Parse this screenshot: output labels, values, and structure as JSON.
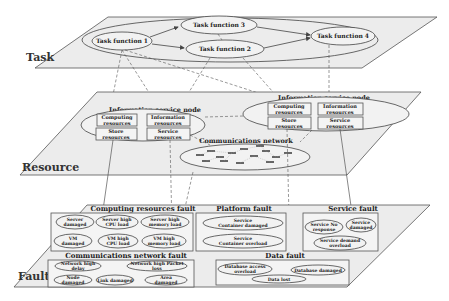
{
  "layers": {
    "task": {
      "label": "Task",
      "functions": [
        "Task function 1",
        "Task function 2",
        "Task function 3",
        "Task function 4"
      ]
    },
    "resource": {
      "label": "Resource",
      "nodes": [
        {
          "title": "Information service node",
          "boxes": [
            {
              "l1": "Computing",
              "l2": "resources"
            },
            {
              "l1": "Information",
              "l2": "resources"
            },
            {
              "l1": "Store",
              "l2": "resources"
            },
            {
              "l1": "Service",
              "l2": "resources"
            }
          ]
        },
        {
          "title": "Information service node",
          "boxes": [
            {
              "l1": "Computing",
              "l2": "resources"
            },
            {
              "l1": "Information",
              "l2": "resources"
            },
            {
              "l1": "Store",
              "l2": "resources"
            },
            {
              "l1": "Service",
              "l2": "resources"
            }
          ]
        }
      ],
      "network_title": "Communications network"
    },
    "fault": {
      "label": "Fault",
      "groups": {
        "computing": {
          "title": "Computing resources fault",
          "items": [
            {
              "l1": "Server",
              "l2": "damaged"
            },
            {
              "l1": "Server high",
              "l2": "CPU load"
            },
            {
              "l1": "Server high",
              "l2": "memory load"
            },
            {
              "l1": "VM",
              "l2": "damaged"
            },
            {
              "l1": "VM high",
              "l2": "CPU load"
            },
            {
              "l1": "VM high",
              "l2": "memory load"
            }
          ]
        },
        "platform": {
          "title": "Platform fault",
          "items": [
            {
              "l1": "Service",
              "l2": "Container damaged"
            },
            {
              "l1": "Service",
              "l2": "Container overload"
            }
          ]
        },
        "service": {
          "title": "Service fault",
          "items": [
            {
              "l1": "Service No",
              "l2": "response"
            },
            {
              "l1": "Service",
              "l2": "damaged"
            },
            {
              "l1": "Service demand",
              "l2": "overload"
            }
          ]
        },
        "network": {
          "title": "Communications network fault",
          "items": [
            {
              "l1": "Network high",
              "l2": "delay"
            },
            {
              "l1": "Network high Packet",
              "l2": "loss"
            },
            {
              "l1": "Node",
              "l2": "damaged"
            },
            {
              "l1": "Link damaged",
              "l2": ""
            },
            {
              "l1": "Area",
              "l2": "damaged"
            }
          ]
        },
        "data": {
          "title": "Data fault",
          "items": [
            {
              "l1": "Database access",
              "l2": "overload"
            },
            {
              "l1": "Database damaged",
              "l2": ""
            },
            {
              "l1": "Data lost",
              "l2": ""
            }
          ]
        }
      }
    }
  }
}
